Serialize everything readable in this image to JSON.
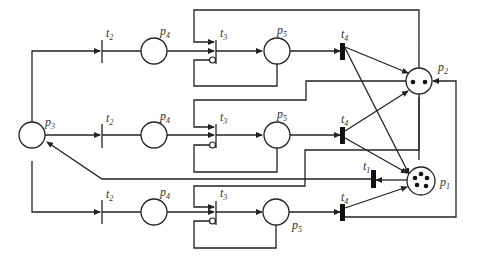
{
  "diagram": {
    "type": "petri-net",
    "places": [
      {
        "id": "p1",
        "label": "p",
        "sub": "1",
        "tokens": 5
      },
      {
        "id": "p2",
        "label": "p",
        "sub": "2",
        "tokens": 2
      },
      {
        "id": "p3",
        "label": "p",
        "sub": "3",
        "tokens": 0
      },
      {
        "id": "p4",
        "label": "p",
        "sub": "4",
        "tokens": 0
      },
      {
        "id": "p5",
        "label": "p",
        "sub": "5",
        "tokens": 0
      }
    ],
    "transitions": [
      {
        "id": "t1",
        "label": "t",
        "sub": "1"
      },
      {
        "id": "t2",
        "label": "t",
        "sub": "2"
      },
      {
        "id": "t3",
        "label": "t",
        "sub": "3"
      },
      {
        "id": "t4",
        "label": "t",
        "sub": "4"
      }
    ],
    "rows": 3,
    "arc_types": [
      "normal",
      "inhibitor"
    ]
  }
}
